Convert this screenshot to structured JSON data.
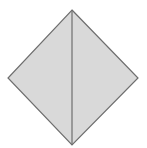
{
  "diagram": {
    "type": "rhombus-split",
    "vertices": {
      "top": [
        72,
        10
      ],
      "right": [
        138,
        78
      ],
      "bottom": [
        72,
        145
      ],
      "left": [
        8,
        78
      ]
    },
    "diagonal": {
      "from": "top",
      "to": "bottom"
    },
    "colors": {
      "fill": "#d9d9d9",
      "stroke": "#6e6e6e",
      "background": "#ffffff"
    },
    "stroke_width": 1.2
  }
}
